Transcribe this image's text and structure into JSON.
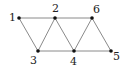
{
  "graph": {
    "nodes": [
      {
        "id": "1",
        "label": "1",
        "x": 19,
        "y": 18,
        "lx": 9,
        "ly": 21
      },
      {
        "id": "2",
        "label": "2",
        "x": 55,
        "y": 18,
        "lx": 52,
        "ly": 12
      },
      {
        "id": "6",
        "label": "6",
        "x": 92,
        "y": 18,
        "lx": 93,
        "ly": 13
      },
      {
        "id": "3",
        "label": "3",
        "x": 38,
        "y": 51,
        "lx": 30,
        "ly": 64
      },
      {
        "id": "4",
        "label": "4",
        "x": 74,
        "y": 51,
        "lx": 70,
        "ly": 65
      },
      {
        "id": "5",
        "label": "5",
        "x": 111,
        "y": 51,
        "lx": 113,
        "ly": 60
      }
    ],
    "edges": [
      [
        "1",
        "2"
      ],
      [
        "2",
        "6"
      ],
      [
        "3",
        "4"
      ],
      [
        "4",
        "5"
      ],
      [
        "1",
        "3"
      ],
      [
        "2",
        "3"
      ],
      [
        "2",
        "4"
      ],
      [
        "6",
        "4"
      ],
      [
        "6",
        "5"
      ]
    ],
    "edge_color": "#8a8a8a",
    "node_color": "#111111"
  }
}
